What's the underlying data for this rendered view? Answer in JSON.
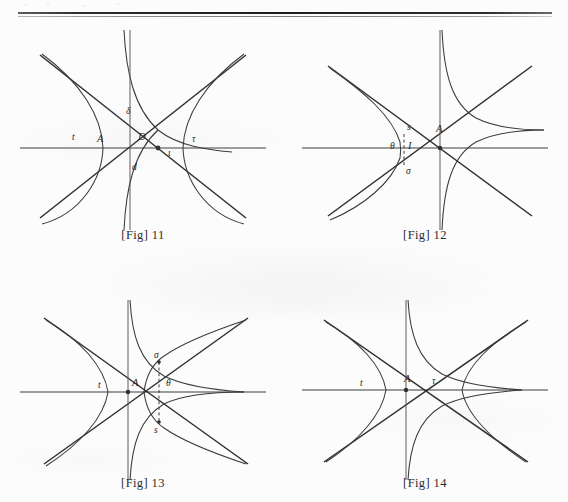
{
  "page": {
    "background_color": "#fcfcfc",
    "ink_color": "#3a3a3a",
    "rule": {
      "name": "top-double-rule",
      "style": "double"
    }
  },
  "figures": [
    {
      "id": "fig-11",
      "caption": "[Fig] 11",
      "caption_bracket_text": "[Fig]",
      "caption_number": "11",
      "labels": [
        {
          "key": "t",
          "text": "t",
          "x": 72,
          "y": 117
        },
        {
          "key": "A",
          "text": "A",
          "x": 97,
          "y": 115
        },
        {
          "key": "D",
          "text": "D",
          "x": 127,
          "y": 112
        },
        {
          "key": "delta",
          "text": "δ",
          "x": 113,
          "y": 95
        },
        {
          "key": "d",
          "text": "d",
          "x": 118,
          "y": 145
        },
        {
          "key": "tau",
          "text": "τ",
          "x": 175,
          "y": 115
        },
        {
          "key": "i",
          "text": "ι",
          "x": 148,
          "y": 124
        }
      ]
    },
    {
      "id": "fig-12",
      "caption": "[Fig] 12",
      "caption_bracket_text": "[Fig]",
      "caption_number": "12",
      "labels": [
        {
          "key": "s",
          "text": "s",
          "x": 110,
          "y": 103
        },
        {
          "key": "A",
          "text": "A",
          "x": 139,
          "y": 105
        },
        {
          "key": "theta",
          "text": "θ",
          "x": 98,
          "y": 119
        },
        {
          "key": "I",
          "text": "I",
          "x": 113,
          "y": 119
        },
        {
          "key": "sigma",
          "text": "σ",
          "x": 110,
          "y": 140
        }
      ]
    },
    {
      "id": "fig-13",
      "caption": "[Fig] 13",
      "caption_bracket_text": "[Fig]",
      "caption_number": "13",
      "labels": [
        {
          "key": "t",
          "text": "t",
          "x": 82,
          "y": 92
        },
        {
          "key": "A",
          "text": "A",
          "x": 118,
          "y": 92
        },
        {
          "key": "sigma",
          "text": "σ",
          "x": 136,
          "y": 68
        },
        {
          "key": "theta",
          "text": "θ",
          "x": 147,
          "y": 92
        },
        {
          "key": "s",
          "text": "s",
          "x": 136,
          "y": 123
        }
      ]
    },
    {
      "id": "fig-14",
      "caption": "[Fig] 14",
      "caption_bracket_text": "[Fig]",
      "caption_number": "14",
      "labels": [
        {
          "key": "t",
          "text": "t",
          "x": 62,
          "y": 84
        },
        {
          "key": "A",
          "text": "A",
          "x": 107,
          "y": 83
        },
        {
          "key": "tau",
          "text": "τ",
          "x": 133,
          "y": 85
        }
      ]
    }
  ]
}
